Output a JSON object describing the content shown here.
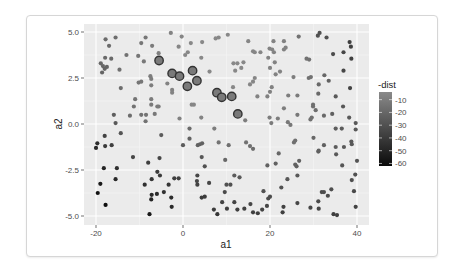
{
  "chart_data": {
    "type": "scatter",
    "title": "",
    "xlabel": "a1",
    "ylabel": "a2",
    "xlim": [
      -22,
      42
    ],
    "ylim": [
      -5.4,
      5.4
    ],
    "x_ticks": [
      -20,
      0,
      20,
      40
    ],
    "x_tick_labels": [
      "-20",
      "0",
      "20",
      "40"
    ],
    "y_ticks": [
      -5.0,
      -2.5,
      0.0,
      2.5,
      5.0
    ],
    "y_tick_labels": [
      "-5.0",
      "-2.5",
      "0.0",
      "2.5",
      "5.0"
    ],
    "grid": true,
    "legend": {
      "title": "-dist",
      "position": "right",
      "type": "colorbar",
      "range": [
        -62,
        -4
      ],
      "ticks": [
        -10,
        -20,
        -30,
        -40,
        -50,
        -60
      ],
      "tick_labels": [
        "-10",
        "-20",
        "-30",
        "-40",
        "-50",
        "-60"
      ],
      "color_low": "#0a0a0a",
      "color_high": "#8a8a8a"
    },
    "highlighted_points": [
      {
        "a1": -5.5,
        "a2": 3.45
      },
      {
        "a1": -2.5,
        "a2": 2.75
      },
      {
        "a1": -0.8,
        "a2": 2.6
      },
      {
        "a1": 2.2,
        "a2": 2.9
      },
      {
        "a1": 1.0,
        "a2": 2.05
      },
      {
        "a1": 3.2,
        "a2": 2.35
      },
      {
        "a1": 7.8,
        "a2": 1.7
      },
      {
        "a1": 8.9,
        "a2": 1.45
      },
      {
        "a1": 11.2,
        "a2": 1.5
      },
      {
        "a1": 12.6,
        "a2": 0.55
      }
    ],
    "points": [
      {
        "a1": -17.8,
        "a2": 4.6,
        "dist": -18
      },
      {
        "a1": -15.5,
        "a2": 4.7,
        "dist": -17
      },
      {
        "a1": -17.0,
        "a2": 4.25,
        "dist": -18
      },
      {
        "a1": -18.9,
        "a2": 3.3,
        "dist": -20
      },
      {
        "a1": -18.4,
        "a2": 3.15,
        "dist": -20
      },
      {
        "a1": -17.9,
        "a2": 3.6,
        "dist": -19
      },
      {
        "a1": -16.5,
        "a2": 3.55,
        "dist": -19
      },
      {
        "a1": -17.5,
        "a2": 3.1,
        "dist": -20
      },
      {
        "a1": -18.6,
        "a2": 2.8,
        "dist": -21
      },
      {
        "a1": -18.0,
        "a2": 3.0,
        "dist": -21
      },
      {
        "a1": -13.0,
        "a2": 3.75,
        "dist": -15
      },
      {
        "a1": -14.6,
        "a2": 2.95,
        "dist": -16
      },
      {
        "a1": -10.3,
        "a2": 3.7,
        "dist": -13
      },
      {
        "a1": -9.6,
        "a2": 4.4,
        "dist": -13
      },
      {
        "a1": -8.6,
        "a2": 4.7,
        "dist": -13
      },
      {
        "a1": -9.0,
        "a2": 3.4,
        "dist": -12
      },
      {
        "a1": -7.1,
        "a2": 4.25,
        "dist": -11
      },
      {
        "a1": -5.6,
        "a2": 3.85,
        "dist": -9
      },
      {
        "a1": -7.5,
        "a2": 2.6,
        "dist": -10
      },
      {
        "a1": -7.3,
        "a2": 2.45,
        "dist": -10
      },
      {
        "a1": -10.2,
        "a2": 2.25,
        "dist": -13
      },
      {
        "a1": -9.6,
        "a2": 2.3,
        "dist": -13
      },
      {
        "a1": -14.3,
        "a2": 1.95,
        "dist": -17
      },
      {
        "a1": -7.3,
        "a2": 2.1,
        "dist": -10
      },
      {
        "a1": -11.0,
        "a2": 1.35,
        "dist": -14
      },
      {
        "a1": -7.3,
        "a2": 1.35,
        "dist": -11
      },
      {
        "a1": -11.3,
        "a2": 0.95,
        "dist": -15
      },
      {
        "a1": -7.3,
        "a2": 1.05,
        "dist": -11
      },
      {
        "a1": -5.9,
        "a2": 0.95,
        "dist": -10
      },
      {
        "a1": -5.6,
        "a2": 0.95,
        "dist": -10
      },
      {
        "a1": -12.2,
        "a2": 0.45,
        "dist": -17
      },
      {
        "a1": -9.6,
        "a2": 0.5,
        "dist": -15
      },
      {
        "a1": -8.5,
        "a2": 0.5,
        "dist": -14
      },
      {
        "a1": -6.5,
        "a2": 0.55,
        "dist": -12
      },
      {
        "a1": -8.6,
        "a2": 0.15,
        "dist": -15
      },
      {
        "a1": -15.9,
        "a2": 0.5,
        "dist": -24
      },
      {
        "a1": -15.5,
        "a2": 0.05,
        "dist": -26
      },
      {
        "a1": -14.3,
        "a2": -0.5,
        "dist": -28
      },
      {
        "a1": -18.0,
        "a2": -0.65,
        "dist": -36
      },
      {
        "a1": -16.4,
        "a2": -1.15,
        "dist": -38
      },
      {
        "a1": -17.9,
        "a2": -1.2,
        "dist": -40
      },
      {
        "a1": -19.7,
        "a2": -1.05,
        "dist": -46
      },
      {
        "a1": -20.0,
        "a2": -1.3,
        "dist": -48
      },
      {
        "a1": -11.5,
        "a2": -1.8,
        "dist": -35
      },
      {
        "a1": -18.2,
        "a2": -2.4,
        "dist": -50
      },
      {
        "a1": -15.2,
        "a2": -2.4,
        "dist": -45
      },
      {
        "a1": -15.5,
        "a2": -3.0,
        "dist": -48
      },
      {
        "a1": -19.0,
        "a2": -3.25,
        "dist": -55
      },
      {
        "a1": -19.6,
        "a2": -3.75,
        "dist": -58
      },
      {
        "a1": -17.8,
        "a2": -4.4,
        "dist": -60
      },
      {
        "a1": -8.0,
        "a2": -2.1,
        "dist": -38
      },
      {
        "a1": -8.8,
        "a2": -3.3,
        "dist": -45
      },
      {
        "a1": -7.2,
        "a2": -3.0,
        "dist": -42
      },
      {
        "a1": -5.9,
        "a2": -2.6,
        "dist": -40
      },
      {
        "a1": -5.3,
        "a2": -2.8,
        "dist": -40
      },
      {
        "a1": -5.4,
        "a2": -1.85,
        "dist": -35
      },
      {
        "a1": -5.0,
        "a2": -0.6,
        "dist": -25
      },
      {
        "a1": -7.2,
        "a2": -3.85,
        "dist": -48
      },
      {
        "a1": -7.3,
        "a2": -4.1,
        "dist": -50
      },
      {
        "a1": -6.0,
        "a2": -3.8,
        "dist": -47
      },
      {
        "a1": -4.4,
        "a2": -3.7,
        "dist": -44
      },
      {
        "a1": -3.3,
        "a2": -3.3,
        "dist": -42
      },
      {
        "a1": -2.7,
        "a2": -4.0,
        "dist": -46
      },
      {
        "a1": -2.6,
        "a2": -4.5,
        "dist": -48
      },
      {
        "a1": -7.7,
        "a2": -4.9,
        "dist": -55
      },
      {
        "a1": -2.0,
        "a2": -2.95,
        "dist": -38
      },
      {
        "a1": -1.0,
        "a2": -2.95,
        "dist": -37
      },
      {
        "a1": 0.0,
        "a2": -1.15,
        "dist": -25
      },
      {
        "a1": 1.5,
        "a2": -0.8,
        "dist": -22
      },
      {
        "a1": 1.5,
        "a2": -0.25,
        "dist": -18
      },
      {
        "a1": 3.3,
        "a2": -2.8,
        "dist": -34
      },
      {
        "a1": 3.2,
        "a2": -3.1,
        "dist": -35
      },
      {
        "a1": 3.3,
        "a2": -3.3,
        "dist": -36
      },
      {
        "a1": 3.4,
        "a2": -1.15,
        "dist": -22
      },
      {
        "a1": 3.9,
        "a2": -1.1,
        "dist": -22
      },
      {
        "a1": 4.4,
        "a2": -1.05,
        "dist": -22
      },
      {
        "a1": 4.3,
        "a2": -1.8,
        "dist": -27
      },
      {
        "a1": 5.0,
        "a2": -2.3,
        "dist": -30
      },
      {
        "a1": 6.0,
        "a2": -3.2,
        "dist": -35
      },
      {
        "a1": 4.3,
        "a2": -4.0,
        "dist": -40
      },
      {
        "a1": 5.0,
        "a2": -3.95,
        "dist": -40
      },
      {
        "a1": -2.8,
        "a2": 4.95,
        "dist": -7
      },
      {
        "a1": -0.3,
        "a2": 4.75,
        "dist": -6
      },
      {
        "a1": 1.8,
        "a2": 4.4,
        "dist": -5
      },
      {
        "a1": 4.4,
        "a2": 4.45,
        "dist": -5
      },
      {
        "a1": 0.5,
        "a2": 3.75,
        "dist": -5
      },
      {
        "a1": 1.1,
        "a2": 3.9,
        "dist": -5
      },
      {
        "a1": 4.2,
        "a2": 3.6,
        "dist": -5
      },
      {
        "a1": 6.1,
        "a2": 2.85,
        "dist": -5
      },
      {
        "a1": -3.6,
        "a2": 2.2,
        "dist": -7
      },
      {
        "a1": -2.5,
        "a2": 1.85,
        "dist": -7
      },
      {
        "a1": -2.5,
        "a2": 1.7,
        "dist": -7
      },
      {
        "a1": 2.0,
        "a2": 1.05,
        "dist": -6
      },
      {
        "a1": 2.5,
        "a2": 1.05,
        "dist": -6
      },
      {
        "a1": -0.8,
        "a2": 0.3,
        "dist": -8
      },
      {
        "a1": 4.2,
        "a2": 0.35,
        "dist": -7
      },
      {
        "a1": 7.5,
        "a2": 4.65,
        "dist": -5
      },
      {
        "a1": 8.2,
        "a2": 4.7,
        "dist": -5
      },
      {
        "a1": 10.3,
        "a2": 4.85,
        "dist": -5
      },
      {
        "a1": 11.6,
        "a2": 3.3,
        "dist": -5
      },
      {
        "a1": 12.5,
        "a2": 3.3,
        "dist": -5
      },
      {
        "a1": 12.0,
        "a2": 2.9,
        "dist": -5
      },
      {
        "a1": 13.4,
        "a2": 3.05,
        "dist": -5
      },
      {
        "a1": 15.0,
        "a2": 4.5,
        "dist": -6
      },
      {
        "a1": 16.1,
        "a2": 3.95,
        "dist": -6
      },
      {
        "a1": 16.5,
        "a2": 3.9,
        "dist": -6
      },
      {
        "a1": 16.5,
        "a2": 2.5,
        "dist": -6
      },
      {
        "a1": 16.1,
        "a2": 2.3,
        "dist": -6
      },
      {
        "a1": 15.4,
        "a2": 2.15,
        "dist": -6
      },
      {
        "a1": 17.1,
        "a2": 1.5,
        "dist": -7
      },
      {
        "a1": 7.2,
        "a2": -0.25,
        "dist": -10
      },
      {
        "a1": 8.2,
        "a2": -1.0,
        "dist": -14
      },
      {
        "a1": 10.5,
        "a2": -1.15,
        "dist": -16
      },
      {
        "a1": 9.7,
        "a2": -1.95,
        "dist": -20
      },
      {
        "a1": 14.3,
        "a2": 0.2,
        "dist": -10
      },
      {
        "a1": 14.5,
        "a2": -1.0,
        "dist": -15
      },
      {
        "a1": 15.4,
        "a2": -1.2,
        "dist": -16
      },
      {
        "a1": 16.1,
        "a2": -1.35,
        "dist": -17
      },
      {
        "a1": 11.8,
        "a2": -2.8,
        "dist": -25
      },
      {
        "a1": 13.0,
        "a2": -2.9,
        "dist": -26
      },
      {
        "a1": 10.0,
        "a2": -3.3,
        "dist": -30
      },
      {
        "a1": 10.9,
        "a2": -3.3,
        "dist": -30
      },
      {
        "a1": 9.6,
        "a2": -3.7,
        "dist": -33
      },
      {
        "a1": 9.0,
        "a2": -4.25,
        "dist": -36
      },
      {
        "a1": 10.1,
        "a2": -4.6,
        "dist": -38
      },
      {
        "a1": 11.8,
        "a2": -4.25,
        "dist": -36
      },
      {
        "a1": 12.5,
        "a2": -4.65,
        "dist": -38
      },
      {
        "a1": 7.1,
        "a2": -4.65,
        "dist": -40
      },
      {
        "a1": 7.9,
        "a2": -4.9,
        "dist": -42
      },
      {
        "a1": 14.1,
        "a2": -4.6,
        "dist": -37
      },
      {
        "a1": 15.5,
        "a2": -4.35,
        "dist": -35
      },
      {
        "a1": 16.1,
        "a2": -4.8,
        "dist": -38
      },
      {
        "a1": 17.2,
        "a2": -4.85,
        "dist": -38
      },
      {
        "a1": 18.2,
        "a2": -4.65,
        "dist": -36
      },
      {
        "a1": 18.5,
        "a2": -3.65,
        "dist": -30
      },
      {
        "a1": 19.6,
        "a2": -4.05,
        "dist": -32
      },
      {
        "a1": 20.0,
        "a2": -3.95,
        "dist": -32
      },
      {
        "a1": 19.3,
        "a2": -4.45,
        "dist": -35
      },
      {
        "a1": 19.4,
        "a2": -2.25,
        "dist": -22
      },
      {
        "a1": 21.3,
        "a2": -2.15,
        "dist": -22
      },
      {
        "a1": 22.0,
        "a2": -1.6,
        "dist": -20
      },
      {
        "a1": 22.6,
        "a2": -3.45,
        "dist": -30
      },
      {
        "a1": 22.9,
        "a2": -4.8,
        "dist": -38
      },
      {
        "a1": 23.1,
        "a2": -4.5,
        "dist": -37
      },
      {
        "a1": 17.8,
        "a2": 3.9,
        "dist": -6
      },
      {
        "a1": 19.9,
        "a2": 4.1,
        "dist": -7
      },
      {
        "a1": 20.5,
        "a2": 4.05,
        "dist": -7
      },
      {
        "a1": 20.8,
        "a2": 4.5,
        "dist": -7
      },
      {
        "a1": 20.9,
        "a2": 3.9,
        "dist": -7
      },
      {
        "a1": 19.6,
        "a2": 3.6,
        "dist": -7
      },
      {
        "a1": 21.1,
        "a2": 3.35,
        "dist": -7
      },
      {
        "a1": 20.0,
        "a2": 3.05,
        "dist": -7
      },
      {
        "a1": 21.3,
        "a2": 2.7,
        "dist": -7
      },
      {
        "a1": 22.3,
        "a2": 2.85,
        "dist": -7
      },
      {
        "a1": 23.2,
        "a2": 4.5,
        "dist": -8
      },
      {
        "a1": 23.2,
        "a2": 4.05,
        "dist": -8
      },
      {
        "a1": 23.6,
        "a2": 4.15,
        "dist": -8
      },
      {
        "a1": 20.4,
        "a2": 2.0,
        "dist": -8
      },
      {
        "a1": 20.0,
        "a2": 1.75,
        "dist": -8
      },
      {
        "a1": 19.4,
        "a2": 1.5,
        "dist": -8
      },
      {
        "a1": 19.9,
        "a2": 0.35,
        "dist": -10
      },
      {
        "a1": 20.3,
        "a2": 0.05,
        "dist": -11
      },
      {
        "a1": 21.8,
        "a2": 0.3,
        "dist": -10
      },
      {
        "a1": 23.2,
        "a2": 0.85,
        "dist": -10
      },
      {
        "a1": 24.2,
        "a2": 1.55,
        "dist": -10
      },
      {
        "a1": 24.1,
        "a2": 0.1,
        "dist": -12
      },
      {
        "a1": 24.7,
        "a2": -0.05,
        "dist": -12
      },
      {
        "a1": 25.4,
        "a2": 2.55,
        "dist": -10
      },
      {
        "a1": 26.3,
        "a2": 1.55,
        "dist": -11
      },
      {
        "a1": 26.3,
        "a2": 0.5,
        "dist": -12
      },
      {
        "a1": 25.5,
        "a2": -1.0,
        "dist": -16
      },
      {
        "a1": 25.8,
        "a2": -0.9,
        "dist": -16
      },
      {
        "a1": 24.0,
        "a2": -3.0,
        "dist": -27
      },
      {
        "a1": 25.8,
        "a2": -2.2,
        "dist": -22
      },
      {
        "a1": 26.1,
        "a2": -2.3,
        "dist": -23
      },
      {
        "a1": 26.7,
        "a2": -2.0,
        "dist": -22
      },
      {
        "a1": 26.3,
        "a2": -2.8,
        "dist": -26
      },
      {
        "a1": 26.3,
        "a2": -4.3,
        "dist": -35
      },
      {
        "a1": 26.6,
        "a2": 4.75,
        "dist": -15
      },
      {
        "a1": 28.4,
        "a2": 3.55,
        "dist": -15
      },
      {
        "a1": 29.0,
        "a2": 3.5,
        "dist": -15
      },
      {
        "a1": 28.9,
        "a2": 2.5,
        "dist": -15
      },
      {
        "a1": 29.4,
        "a2": 2.55,
        "dist": -15
      },
      {
        "a1": 29.3,
        "a2": 0.25,
        "dist": -16
      },
      {
        "a1": 29.6,
        "a2": 0.35,
        "dist": -16
      },
      {
        "a1": 29.9,
        "a2": 1.05,
        "dist": -16
      },
      {
        "a1": 29.9,
        "a2": 0.95,
        "dist": -16
      },
      {
        "a1": 30.5,
        "a2": 0.75,
        "dist": -17
      },
      {
        "a1": 30.0,
        "a2": -0.75,
        "dist": -20
      },
      {
        "a1": 31.1,
        "a2": -1.5,
        "dist": -23
      },
      {
        "a1": 31.2,
        "a2": -1.45,
        "dist": -23
      },
      {
        "a1": 32.4,
        "a2": -1.15,
        "dist": -23
      },
      {
        "a1": 32.4,
        "a2": 0.45,
        "dist": -19
      },
      {
        "a1": 31.1,
        "a2": 1.65,
        "dist": -19
      },
      {
        "a1": 31.2,
        "a2": 2.15,
        "dist": -19
      },
      {
        "a1": 32.5,
        "a2": 2.65,
        "dist": -20
      },
      {
        "a1": 33.5,
        "a2": 2.35,
        "dist": -22
      },
      {
        "a1": 29.3,
        "a2": -4.55,
        "dist": -35
      },
      {
        "a1": 31.2,
        "a2": -4.6,
        "dist": -35
      },
      {
        "a1": 31.1,
        "a2": -4.2,
        "dist": -33
      },
      {
        "a1": 31.9,
        "a2": -3.7,
        "dist": -31
      },
      {
        "a1": 32.4,
        "a2": -3.7,
        "dist": -31
      },
      {
        "a1": 33.3,
        "a2": -3.9,
        "dist": -32
      },
      {
        "a1": 34.1,
        "a2": -3.55,
        "dist": -31
      },
      {
        "a1": 34.6,
        "a2": -4.9,
        "dist": -38
      },
      {
        "a1": 35.4,
        "a2": -4.95,
        "dist": -38
      },
      {
        "a1": 31.0,
        "a2": 4.8,
        "dist": -30
      },
      {
        "a1": 31.4,
        "a2": 4.95,
        "dist": -30
      },
      {
        "a1": 33.0,
        "a2": 4.7,
        "dist": -30
      },
      {
        "a1": 34.5,
        "a2": 3.8,
        "dist": -32
      },
      {
        "a1": 36.9,
        "a2": 3.9,
        "dist": -35
      },
      {
        "a1": 36.9,
        "a2": 2.9,
        "dist": -35
      },
      {
        "a1": 38.3,
        "a2": 4.45,
        "dist": -38
      },
      {
        "a1": 38.6,
        "a2": 4.2,
        "dist": -38
      },
      {
        "a1": 38.7,
        "a2": 3.55,
        "dist": -37
      },
      {
        "a1": 38.4,
        "a2": 1.95,
        "dist": -36
      },
      {
        "a1": 35.1,
        "a2": 1.5,
        "dist": -26
      },
      {
        "a1": 36.8,
        "a2": 0.95,
        "dist": -27
      },
      {
        "a1": 34.3,
        "a2": 0.55,
        "dist": -23
      },
      {
        "a1": 35.1,
        "a2": -0.25,
        "dist": -24
      },
      {
        "a1": 36.5,
        "a2": -0.25,
        "dist": -25
      },
      {
        "a1": 38.2,
        "a2": 0.35,
        "dist": -26
      },
      {
        "a1": 39.7,
        "a2": 0.05,
        "dist": -26
      },
      {
        "a1": 39.7,
        "a2": -0.3,
        "dist": -26
      },
      {
        "a1": 38.7,
        "a2": -0.95,
        "dist": -26
      },
      {
        "a1": 38.8,
        "a2": -1.1,
        "dist": -26
      },
      {
        "a1": 35.1,
        "a2": -1.25,
        "dist": -25
      },
      {
        "a1": 35.2,
        "a2": -1.65,
        "dist": -26
      },
      {
        "a1": 37.0,
        "a2": -1.25,
        "dist": -26
      },
      {
        "a1": 36.6,
        "a2": -2.25,
        "dist": -28
      },
      {
        "a1": 40.0,
        "a2": -2.0,
        "dist": -28
      },
      {
        "a1": 38.8,
        "a2": -3.05,
        "dist": -31
      },
      {
        "a1": 39.6,
        "a2": -2.75,
        "dist": -30
      },
      {
        "a1": 39.3,
        "a2": -3.65,
        "dist": -33
      },
      {
        "a1": 39.7,
        "a2": -4.5,
        "dist": -36
      },
      {
        "a1": -1.0,
        "a2": 4.2,
        "dist": -6
      },
      {
        "a1": 11.5,
        "a2": 2.0,
        "dist": -5
      },
      {
        "a1": 13.9,
        "a2": 3.35,
        "dist": -5
      }
    ]
  }
}
